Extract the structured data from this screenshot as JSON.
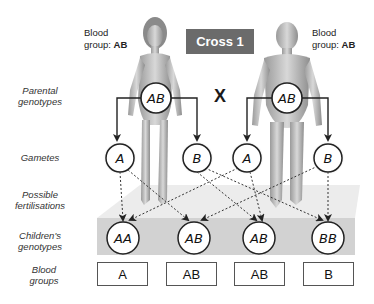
{
  "title": "Cross 1",
  "cross_symbol": "X",
  "parents": [
    {
      "side": "left",
      "figure": "female",
      "blood_group_label": "Blood",
      "blood_group_label2": "group:",
      "blood_group_value": "AB",
      "genotype": "AB"
    },
    {
      "side": "right",
      "figure": "male",
      "blood_group_label": "Blood",
      "blood_group_label2": "group:",
      "blood_group_value": "AB",
      "genotype": "AB"
    }
  ],
  "row_labels": {
    "parental_genotypes": [
      "Parental",
      "genotypes"
    ],
    "gametes": [
      "Gametes"
    ],
    "possible_fertilisations": [
      "Possible",
      "fertilisations"
    ],
    "childrens_genotypes": [
      "Children's",
      "genotypes"
    ],
    "blood_groups": [
      "Blood",
      "groups"
    ]
  },
  "gametes": [
    "A",
    "B",
    "A",
    "B"
  ],
  "children": [
    {
      "genotype": "AA",
      "blood_group": "A"
    },
    {
      "genotype": "AB",
      "blood_group": "AB"
    },
    {
      "genotype": "AB",
      "blood_group": "AB"
    },
    {
      "genotype": "BB",
      "blood_group": "B"
    }
  ],
  "colors": {
    "title_box": "#6b6b6b",
    "platform_light": "#e6e6e6",
    "platform_dark": "#cfcfcf",
    "line": "#222222"
  }
}
